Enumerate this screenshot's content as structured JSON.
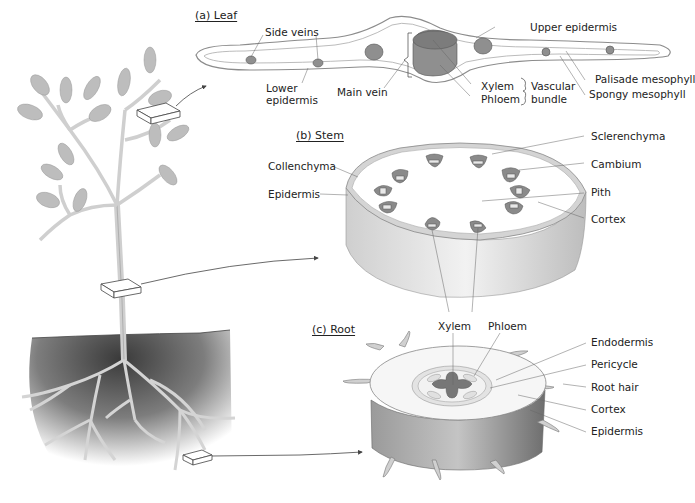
{
  "figure": {
    "panels": [
      {
        "id": "leaf",
        "title": "(a) Leaf"
      },
      {
        "id": "stem",
        "title": "(b) Stem"
      },
      {
        "id": "root",
        "title": "(c) Root"
      }
    ]
  },
  "leaf": {
    "title": "(a) Leaf",
    "labels": {
      "side_veins": "Side veins",
      "upper_epidermis": "Upper epidermis",
      "lower_epidermis_1": "Lower",
      "lower_epidermis_2": "epidermis",
      "main_vein": "Main vein",
      "xylem": "Xylem",
      "phloem": "Phloem",
      "vascular_bundle_1": "Vascular",
      "vascular_bundle_2": "bundle",
      "palisade_mesophyll": "Palisade mesophyll",
      "spongy_mesophyll": "Spongy mesophyll"
    }
  },
  "stem": {
    "title": "(b) Stem",
    "labels": {
      "collenchyma": "Collenchyma",
      "epidermis": "Epidermis",
      "sclerenchyma": "Sclerenchyma",
      "cambium": "Cambium",
      "pith": "Pith",
      "cortex": "Cortex",
      "xylem": "Xylem",
      "phloem": "Phloem"
    }
  },
  "root": {
    "title": "(c) Root",
    "labels": {
      "endodermis": "Endodermis",
      "pericycle": "Pericycle",
      "root_hair": "Root hair",
      "cortex": "Cortex",
      "epidermis": "Epidermis"
    }
  },
  "colors": {
    "tissue_dark": "#7a7a7a",
    "tissue_mid": "#a8a8a8",
    "tissue_light": "#d9d9d9",
    "soil": "#555555",
    "line": "#555555"
  }
}
